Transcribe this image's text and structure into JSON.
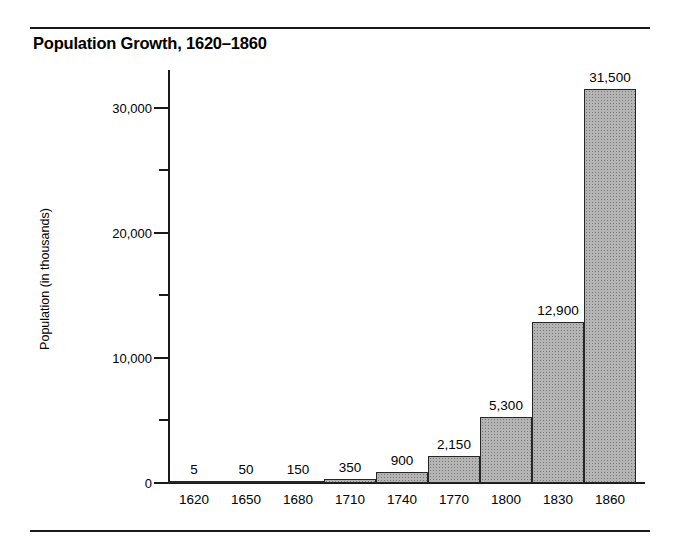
{
  "chart_data": {
    "type": "bar",
    "title": "Population Growth, 1620–1860",
    "xlabel": "",
    "ylabel": "Population (in thousands)",
    "categories": [
      "1620",
      "1650",
      "1680",
      "1710",
      "1740",
      "1770",
      "1800",
      "1830",
      "1860"
    ],
    "values": [
      5,
      50,
      150,
      350,
      900,
      2150,
      5300,
      12900,
      31500
    ],
    "value_labels": [
      "5",
      "50",
      "150",
      "350",
      "900",
      "2,150",
      "5,300",
      "12,900",
      "31,500"
    ],
    "ylim": [
      0,
      33000
    ],
    "y_major_ticks": [
      0,
      10000,
      20000,
      30000
    ],
    "y_major_tick_labels": [
      "0",
      "10,000",
      "20,000",
      "30,000"
    ],
    "y_minor_ticks": [
      5000,
      15000,
      25000
    ],
    "grid": false,
    "legend": null,
    "bar_fill_color": "#b4b4b4",
    "bar_edge_color": "#262626",
    "rule_color": "#1a1a1a"
  }
}
